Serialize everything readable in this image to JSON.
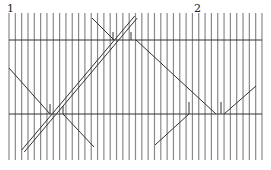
{
  "labels": [
    {
      "text": "1",
      "x": 7,
      "y": 12
    },
    {
      "text": "2",
      "x": 194,
      "y": 12
    }
  ],
  "grid": {
    "vertical_count": 41,
    "x_start": 9,
    "x_end": 262,
    "y_top": 13,
    "y_bottom": 160,
    "horizontal_lines_y": [
      40,
      114
    ],
    "line_color": "#8a8a8a",
    "h_line_color": "#333333"
  },
  "double_line": {
    "x1": 23,
    "y1": 151,
    "x2": 136,
    "y2": 17,
    "color": "#333333"
  },
  "segments": [
    {
      "x1": 92,
      "y1": 18,
      "x2": 114,
      "y2": 40
    },
    {
      "x1": 136,
      "y1": 40,
      "x2": 216,
      "y2": 114
    },
    {
      "x1": 224,
      "y1": 114,
      "x2": 256,
      "y2": 86
    },
    {
      "x1": 9,
      "y1": 68,
      "x2": 50,
      "y2": 114
    },
    {
      "x1": 63,
      "y1": 114,
      "x2": 94,
      "y2": 147
    },
    {
      "x1": 189,
      "y1": 114,
      "x2": 155,
      "y2": 145
    }
  ],
  "ticks": [
    {
      "x": 113,
      "y1": 32,
      "y2": 40
    },
    {
      "x": 131,
      "y1": 32,
      "y2": 40
    },
    {
      "x": 50,
      "y1": 104,
      "y2": 114
    },
    {
      "x": 63,
      "y1": 106,
      "y2": 114
    },
    {
      "x": 189,
      "y1": 102,
      "y2": 114
    },
    {
      "x": 221,
      "y1": 102,
      "y2": 114
    }
  ]
}
